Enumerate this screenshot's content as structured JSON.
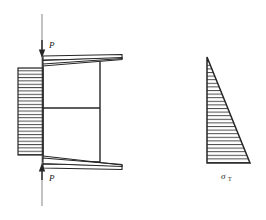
{
  "figure": {
    "type": "engineering-stress-diagram",
    "background_color": "#ffffff",
    "line_color": "#262626",
    "hatch_color": "#555555",
    "labels": {
      "load_top": "P",
      "load_bottom": "P",
      "stress_symbol": "σ",
      "stress_subscript": "T"
    },
    "left_diagram": {
      "name": "loaded-member-with-stress-blocks",
      "axis": {
        "x": 42,
        "y_top": 14,
        "y_bottom": 206
      },
      "arrow_top": {
        "x": 42,
        "y": 55,
        "direction": "down"
      },
      "arrow_bottom": {
        "x": 42,
        "y": 165,
        "direction": "up"
      },
      "body": {
        "x_left": 43,
        "x_right": 100,
        "y_top": 58,
        "y_bottom": 162
      },
      "mid_line_y": 108,
      "hatched_block": {
        "x": 18,
        "y": 68,
        "width": 25,
        "height": 87,
        "hatch_lines": 26
      },
      "top_wedge": {
        "apex_x": 43,
        "tip_x": 122,
        "y": 58,
        "thickness": 9
      },
      "bottom_wedge": {
        "apex_x": 43,
        "tip_x": 122,
        "y": 162,
        "thickness": 9
      }
    },
    "right_diagram": {
      "name": "triangular-stress-distribution",
      "apex": {
        "x": 207,
        "y": 57
      },
      "bottom_left": {
        "x": 207,
        "y": 163
      },
      "bottom_right": {
        "x": 250,
        "y": 163
      },
      "hatch_lines": 30,
      "label_position": {
        "x": 227,
        "y": 178
      }
    }
  }
}
